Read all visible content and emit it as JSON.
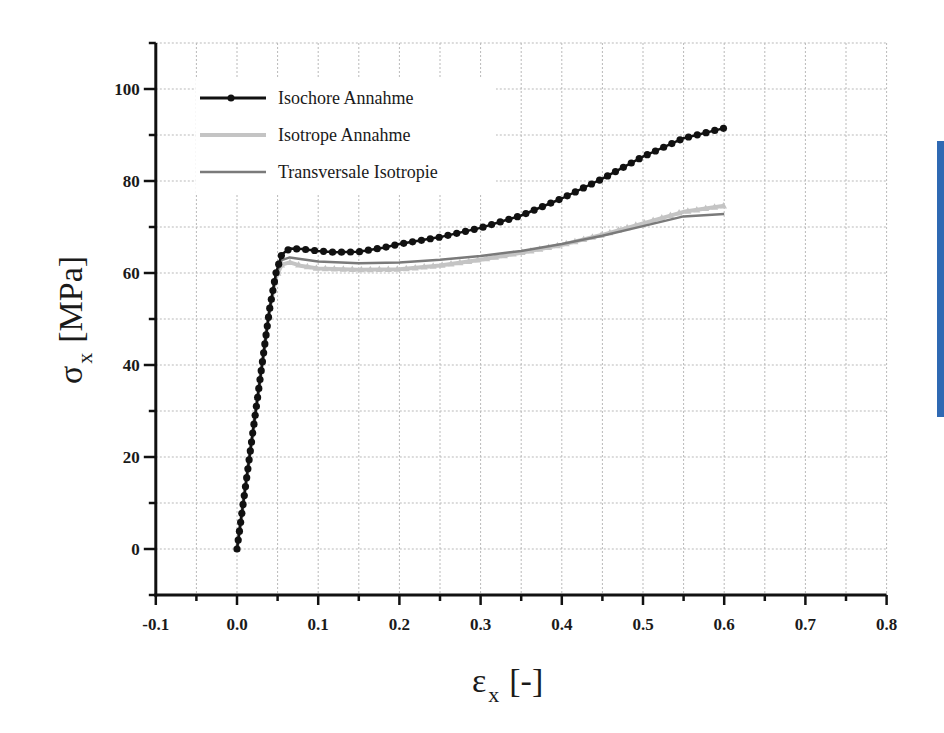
{
  "chart_data": {
    "type": "line",
    "title": "",
    "xlabel": "εx [-]",
    "ylabel": "σx [MPa]",
    "xlabel_parts": {
      "symbol": "ε",
      "sub": "x",
      "unit": "[-]"
    },
    "ylabel_parts": {
      "symbol": "σ",
      "sub": "x",
      "unit": "[MPa]"
    },
    "xlim": [
      -0.1,
      0.8
    ],
    "ylim": [
      -10,
      110
    ],
    "xticks": [
      -0.1,
      0.0,
      0.1,
      0.2,
      0.3,
      0.4,
      0.5,
      0.6,
      0.7,
      0.8
    ],
    "xtick_labels": [
      "-0.1",
      "0.0",
      "0.1",
      "0.2",
      "0.3",
      "0.4",
      "0.5",
      "0.6",
      "0.7",
      "0.8"
    ],
    "yticks": [
      0,
      20,
      40,
      60,
      80,
      100
    ],
    "ytick_labels": [
      "0",
      "20",
      "40",
      "60",
      "80",
      "100"
    ],
    "grid": true,
    "legend_position": "upper left",
    "series": [
      {
        "name": "Isochore Annahme",
        "color": "#111111",
        "marker": "circle",
        "x": [
          0.0,
          0.01,
          0.02,
          0.03,
          0.04,
          0.048,
          0.055,
          0.065,
          0.08,
          0.1,
          0.12,
          0.15,
          0.18,
          0.2,
          0.25,
          0.3,
          0.35,
          0.4,
          0.45,
          0.5,
          0.55,
          0.6
        ],
        "y": [
          0,
          13,
          26,
          39,
          52,
          60,
          64.0,
          65.3,
          65.2,
          64.8,
          64.5,
          64.6,
          65.5,
          66.3,
          67.8,
          69.8,
          72.5,
          76.2,
          80.5,
          85.3,
          89.3,
          91.5
        ]
      },
      {
        "name": "Isotrope Annahme",
        "color": "#c4c4c4",
        "marker": "triangle",
        "x": [
          0.0,
          0.01,
          0.02,
          0.03,
          0.04,
          0.048,
          0.055,
          0.065,
          0.08,
          0.1,
          0.15,
          0.2,
          0.25,
          0.3,
          0.35,
          0.4,
          0.45,
          0.5,
          0.55,
          0.6
        ],
        "y": [
          0,
          13,
          26,
          39,
          52,
          59,
          61.8,
          62.3,
          61.5,
          61.0,
          60.7,
          60.8,
          61.6,
          62.9,
          64.4,
          66.1,
          68.3,
          70.8,
          73.3,
          74.6
        ]
      },
      {
        "name": "Transversale Isotropie",
        "color": "#7a7a7a",
        "marker": "none",
        "x": [
          0.0,
          0.01,
          0.02,
          0.03,
          0.04,
          0.048,
          0.055,
          0.065,
          0.08,
          0.1,
          0.15,
          0.2,
          0.25,
          0.3,
          0.35,
          0.4,
          0.45,
          0.5,
          0.55,
          0.6
        ],
        "y": [
          0,
          13,
          26,
          39,
          52,
          59.5,
          62.8,
          63.4,
          63.0,
          62.5,
          62.1,
          62.3,
          62.9,
          63.7,
          64.8,
          66.3,
          68.1,
          70.2,
          72.3,
          72.8
        ]
      }
    ]
  },
  "legend": {
    "items": [
      {
        "label": "Isochore Annahme"
      },
      {
        "label": "Isotrope Annahme"
      },
      {
        "label": "Transversale Isotropie"
      }
    ]
  },
  "axes": {
    "y_title": {
      "symbol": "σ",
      "sub": "x",
      "unit": "[MPa]"
    },
    "x_title": {
      "symbol": "ε",
      "sub": "x",
      "unit": "[-]"
    }
  },
  "side_bar": {
    "color": "#2f69b3"
  }
}
